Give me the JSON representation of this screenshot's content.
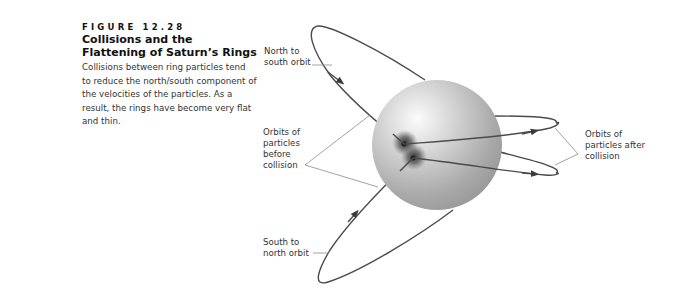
{
  "figure": {
    "number": "FIGURE 12.28",
    "title": "Collisions and the Flattening of Saturn’s Rings",
    "caption": "Collisions between ring particles tend to reduce the north/south component of the velocities of the particles. As a result, the rings have become very flat and thin."
  },
  "diagram": {
    "labels": {
      "north_to_south": "North to\nsouth orbit",
      "south_to_north": "South to\nnorth orbit",
      "before_collision": "Orbits of\nparticles\nbefore\ncollision",
      "after_collision": "Orbits of\nparticles after\ncollision"
    },
    "colors": {
      "orbit_line": "#4a4a4a",
      "leader_line": "#8a8a8a",
      "sphere_light": "#f4f4f4",
      "sphere_dark": "#9a9a9a",
      "collision_burst": "#555555"
    },
    "icons": [
      "sphere-planet-icon",
      "collision-burst-icon",
      "arrowhead-icon"
    ]
  }
}
